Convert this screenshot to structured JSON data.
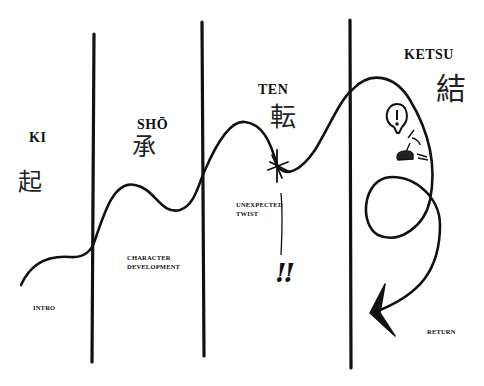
{
  "diagram": {
    "type": "kishotenketsu-story-structure",
    "stages": [
      {
        "id": "ki",
        "title": "KI",
        "kanji": "起",
        "caption": "INTRO"
      },
      {
        "id": "sho",
        "title": "SHŌ",
        "kanji": "承",
        "caption_lines": [
          "CHARACTER",
          "DEVELOPMENT"
        ]
      },
      {
        "id": "ten",
        "title": "TEN",
        "kanji": "転",
        "caption_lines": [
          "UNEXPECTED",
          "TWIST"
        ],
        "exclamation": "!!"
      },
      {
        "id": "ketsu",
        "title": "KETSU",
        "kanji": "結",
        "caption": "RETURN"
      }
    ],
    "colors": {
      "ink": "#111111",
      "background": "#ffffff"
    }
  }
}
